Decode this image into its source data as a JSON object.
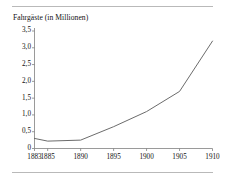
{
  "chart_data": {
    "type": "line",
    "title": "Fahrgäste (in Millionen)",
    "xlabel": "",
    "ylabel": "",
    "grid": false,
    "legend": "none",
    "x": [
      1883,
      1885,
      1890,
      1895,
      1900,
      1905,
      1910
    ],
    "x_tick_labels": [
      "1883",
      "1885",
      "1890",
      "1895",
      "1900",
      "1905",
      "1910"
    ],
    "y_tick_labels": [
      "3,5",
      "3,0",
      "2,5",
      "2,0",
      "1,5",
      "1,0",
      "0,5",
      "0"
    ],
    "y_tick_values": [
      3.5,
      3.0,
      2.5,
      2.0,
      1.5,
      1.0,
      0.5,
      0
    ],
    "xlim": [
      1883,
      1910
    ],
    "ylim": [
      0,
      3.5
    ],
    "series": [
      {
        "name": "Fahrgäste",
        "values": [
          0.3,
          0.22,
          0.25,
          0.65,
          1.1,
          1.7,
          3.2
        ],
        "color": "#5a5a5a"
      }
    ],
    "axis_color": "#808080",
    "line_width": 0.9
  },
  "figure": {
    "title": "Fahrgäste (in Millionen)",
    "rule_color": "#b9b9b9",
    "background": "#ffffff"
  }
}
